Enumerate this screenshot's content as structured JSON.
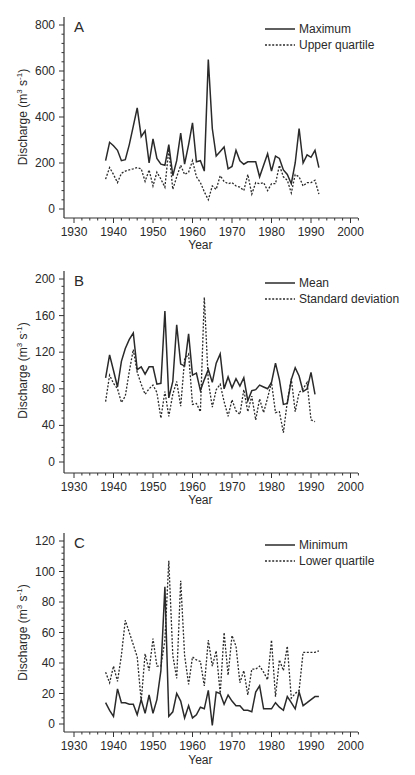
{
  "chart_data": [
    {
      "type": "line",
      "panel_label": "A",
      "title": "",
      "xlabel": "Year",
      "ylabel": "Discharge (m^3 s^-1)",
      "xlim": [
        1930,
        2000
      ],
      "ylim": [
        0,
        800
      ],
      "xticks": [
        1930,
        1940,
        1950,
        1960,
        1970,
        1980,
        1990,
        2000
      ],
      "yticks": [
        0,
        200,
        400,
        600,
        800
      ],
      "legend_position": "upper right",
      "grid": false,
      "x": [
        1938,
        1939,
        1940,
        1941,
        1942,
        1943,
        1944,
        1945,
        1946,
        1947,
        1948,
        1949,
        1950,
        1951,
        1952,
        1953,
        1954,
        1955,
        1956,
        1957,
        1958,
        1959,
        1960,
        1961,
        1962,
        1963,
        1964,
        1965,
        1966,
        1967,
        1968,
        1969,
        1970,
        1971,
        1972,
        1973,
        1974,
        1975,
        1976,
        1977,
        1978,
        1979,
        1980,
        1981,
        1982,
        1983,
        1984,
        1985,
        1986,
        1987,
        1988,
        1989,
        1990,
        1991,
        1992
      ],
      "series": [
        {
          "name": "Maximum",
          "style": "solid",
          "values": [
            210,
            290,
            275,
            255,
            210,
            215,
            280,
            360,
            440,
            315,
            340,
            200,
            305,
            220,
            195,
            190,
            280,
            145,
            210,
            330,
            195,
            280,
            375,
            205,
            210,
            165,
            650,
            350,
            230,
            250,
            270,
            175,
            185,
            255,
            210,
            195,
            205,
            205,
            205,
            140,
            190,
            240,
            165,
            230,
            220,
            170,
            150,
            110,
            200,
            350,
            200,
            235,
            225,
            255,
            180
          ]
        },
        {
          "name": "Upper quartile",
          "style": "dotted",
          "values": [
            130,
            180,
            150,
            115,
            155,
            165,
            170,
            175,
            180,
            175,
            120,
            170,
            100,
            160,
            130,
            95,
            260,
            85,
            140,
            190,
            150,
            160,
            210,
            140,
            115,
            75,
            40,
            100,
            85,
            145,
            120,
            110,
            115,
            100,
            95,
            80,
            150,
            65,
            115,
            110,
            115,
            80,
            110,
            110,
            190,
            140,
            125,
            70,
            150,
            140,
            100,
            115,
            115,
            125,
            65
          ]
        }
      ]
    },
    {
      "type": "line",
      "panel_label": "B",
      "title": "",
      "xlabel": "Year",
      "ylabel": "Discharge (m^3 s^-1)",
      "xlim": [
        1930,
        2000
      ],
      "ylim": [
        0,
        200
      ],
      "xticks": [
        1930,
        1940,
        1950,
        1960,
        1970,
        1980,
        1990,
        2000
      ],
      "yticks": [
        0,
        40,
        80,
        120,
        160,
        200
      ],
      "legend_position": "upper right",
      "grid": false,
      "x": [
        1938,
        1939,
        1940,
        1941,
        1942,
        1943,
        1944,
        1945,
        1946,
        1947,
        1948,
        1949,
        1950,
        1951,
        1952,
        1953,
        1954,
        1955,
        1956,
        1957,
        1958,
        1959,
        1960,
        1961,
        1962,
        1963,
        1964,
        1965,
        1966,
        1967,
        1968,
        1969,
        1970,
        1971,
        1972,
        1973,
        1974,
        1975,
        1976,
        1977,
        1978,
        1979,
        1980,
        1981,
        1982,
        1983,
        1984,
        1985,
        1986,
        1987,
        1988,
        1989,
        1990,
        1991
      ],
      "series": [
        {
          "name": "Mean",
          "style": "solid",
          "values": [
            92,
            117,
            100,
            82,
            110,
            124,
            134,
            141,
            101,
            104,
            96,
            104,
            104,
            85,
            86,
            165,
            70,
            88,
            150,
            107,
            105,
            140,
            95,
            97,
            78,
            90,
            101,
            87,
            108,
            118,
            80,
            93,
            81,
            91,
            83,
            92,
            67,
            78,
            79,
            84,
            82,
            80,
            87,
            108,
            90,
            63,
            64,
            90,
            103,
            94,
            77,
            80,
            98,
            74
          ]
        },
        {
          "name": "Standard deviation",
          "style": "dotted",
          "values": [
            66,
            95,
            86,
            80,
            65,
            72,
            99,
            123,
            98,
            85,
            74,
            80,
            84,
            76,
            48,
            77,
            50,
            74,
            88,
            61,
            112,
            118,
            63,
            64,
            55,
            180,
            88,
            60,
            79,
            85,
            66,
            50,
            68,
            56,
            52,
            79,
            55,
            72,
            46,
            69,
            54,
            70,
            87,
            54,
            55,
            32,
            66,
            91,
            55,
            76,
            80,
            87,
            46,
            44
          ]
        }
      ]
    },
    {
      "type": "line",
      "panel_label": "C",
      "title": "",
      "xlabel": "Year",
      "ylabel": "Discharge (m^3 s^-1)",
      "xlim": [
        1930,
        2000
      ],
      "ylim": [
        0,
        120
      ],
      "xticks": [
        1930,
        1940,
        1950,
        1960,
        1970,
        1980,
        1990,
        2000
      ],
      "yticks": [
        0,
        20,
        40,
        60,
        80,
        100,
        120
      ],
      "legend_position": "upper right",
      "grid": false,
      "x": [
        1938,
        1939,
        1940,
        1941,
        1942,
        1943,
        1944,
        1945,
        1946,
        1947,
        1948,
        1949,
        1950,
        1951,
        1952,
        1953,
        1954,
        1955,
        1956,
        1957,
        1958,
        1959,
        1960,
        1961,
        1962,
        1963,
        1964,
        1965,
        1966,
        1967,
        1968,
        1969,
        1970,
        1971,
        1972,
        1973,
        1974,
        1975,
        1976,
        1977,
        1978,
        1979,
        1980,
        1981,
        1982,
        1983,
        1984,
        1985,
        1986,
        1987,
        1988,
        1989,
        1990,
        1991,
        1992
      ],
      "series": [
        {
          "name": "Minimum",
          "style": "solid",
          "values": [
            14,
            9,
            5,
            23,
            14,
            14,
            13,
            13,
            6,
            16,
            7,
            19,
            7,
            16,
            35,
            90,
            5,
            8,
            20,
            15,
            4,
            12,
            4,
            6,
            11,
            10,
            22,
            -1,
            21,
            20,
            13,
            19,
            15,
            12,
            12,
            9,
            9,
            8,
            21,
            25,
            10,
            10,
            10,
            14,
            11,
            9,
            18,
            14,
            10,
            21,
            12,
            14,
            16,
            18,
            18
          ]
        },
        {
          "name": "Lower quartile",
          "style": "dotted",
          "values": [
            34,
            27,
            38,
            28,
            45,
            68,
            60,
            52,
            44,
            15,
            46,
            35,
            56,
            38,
            38,
            55,
            107,
            45,
            30,
            94,
            45,
            26,
            44,
            42,
            41,
            25,
            55,
            38,
            48,
            20,
            60,
            32,
            58,
            51,
            27,
            35,
            19,
            36,
            36,
            38,
            34,
            29,
            55,
            18,
            42,
            35,
            51,
            17,
            20,
            22,
            47,
            47,
            47,
            47,
            48
          ]
        }
      ]
    }
  ],
  "panels": [
    {
      "label": "A",
      "legend": [
        "Maximum",
        "Upper quartile"
      ],
      "yticks": [
        "0",
        "200",
        "400",
        "600",
        "800"
      ]
    },
    {
      "label": "B",
      "legend": [
        "Mean",
        "Standard deviation"
      ],
      "yticks": [
        "0",
        "40",
        "80",
        "120",
        "160",
        "200"
      ]
    },
    {
      "label": "C",
      "legend": [
        "Minimum",
        "Lower quartile"
      ],
      "yticks": [
        "0",
        "20",
        "40",
        "60",
        "80",
        "100",
        "120"
      ]
    }
  ],
  "axes": {
    "xlabel": "Year",
    "ylabel_main": "Discharge (m",
    "ylabel_sup": "3",
    "ylabel_mid": " s",
    "ylabel_sup2": "-1",
    "ylabel_end": ")",
    "xticks": [
      "1930",
      "1940",
      "1950",
      "1960",
      "1970",
      "1980",
      "1990",
      "2000"
    ]
  },
  "colors": {
    "line": "#2a2a2a",
    "axis": "#333333",
    "background": "#ffffff"
  }
}
